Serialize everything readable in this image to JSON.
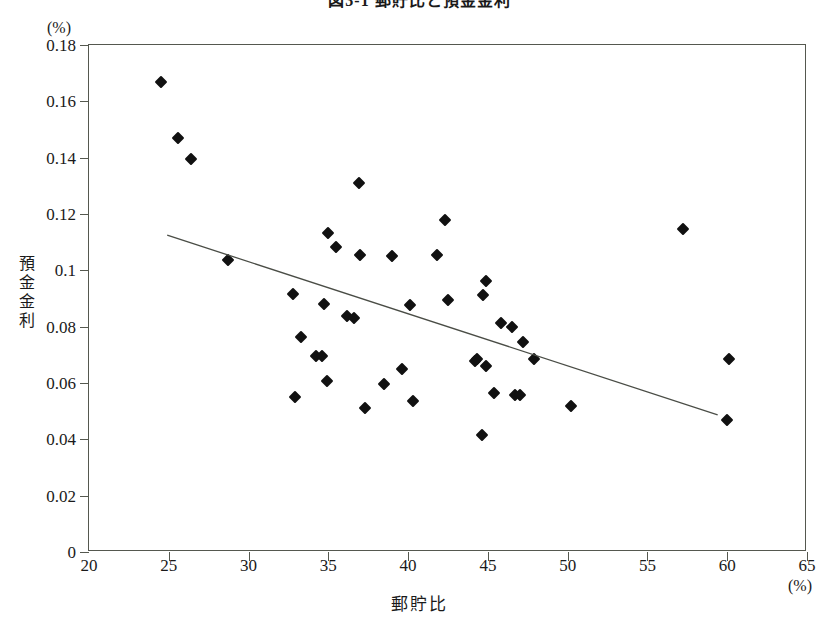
{
  "chart_data": {
    "type": "scatter",
    "title": "図3-1 郵貯比と預金金利",
    "xlabel": "郵貯比",
    "ylabel": "預金金利",
    "x_unit": "(%)",
    "y_unit": "(%)",
    "xlim": [
      20,
      65
    ],
    "ylim": [
      0,
      0.18
    ],
    "grid": false,
    "legend": "none",
    "x_ticks": [
      "20",
      "25",
      "30",
      "35",
      "40",
      "45",
      "50",
      "55",
      "60",
      "65"
    ],
    "x_tick_values": [
      20,
      25,
      30,
      35,
      40,
      45,
      50,
      55,
      60,
      65
    ],
    "y_ticks": [
      "0",
      "0.02",
      "0.04",
      "0.06",
      "0.08",
      "0.1",
      "0.12",
      "0.14",
      "0.16",
      "0.18"
    ],
    "y_tick_values": [
      0,
      0.02,
      0.04,
      0.06,
      0.08,
      0.1,
      0.12,
      0.14,
      0.16,
      0.18
    ],
    "marker": "filled-diamond",
    "marker_color": "#111111",
    "axis_color": "#55584f",
    "trendline": {
      "label": "regression-line",
      "color": "#4a4d46",
      "x_start": 24.9,
      "y_start": 0.1125,
      "x_end": 59.4,
      "y_end": 0.0487
    },
    "points": [
      {
        "x": 24.5,
        "y": 0.167
      },
      {
        "x": 25.6,
        "y": 0.147
      },
      {
        "x": 26.4,
        "y": 0.1395
      },
      {
        "x": 28.7,
        "y": 0.1035
      },
      {
        "x": 32.8,
        "y": 0.0915
      },
      {
        "x": 32.9,
        "y": 0.0551
      },
      {
        "x": 33.3,
        "y": 0.0763
      },
      {
        "x": 34.2,
        "y": 0.0697
      },
      {
        "x": 34.6,
        "y": 0.0695
      },
      {
        "x": 34.7,
        "y": 0.0879
      },
      {
        "x": 34.9,
        "y": 0.0607
      },
      {
        "x": 35.0,
        "y": 0.1133
      },
      {
        "x": 35.5,
        "y": 0.1084
      },
      {
        "x": 36.2,
        "y": 0.0837
      },
      {
        "x": 36.6,
        "y": 0.0832
      },
      {
        "x": 36.9,
        "y": 0.131
      },
      {
        "x": 37.0,
        "y": 0.1055
      },
      {
        "x": 37.3,
        "y": 0.0512
      },
      {
        "x": 38.5,
        "y": 0.0598
      },
      {
        "x": 39.0,
        "y": 0.1051
      },
      {
        "x": 39.6,
        "y": 0.0648
      },
      {
        "x": 40.1,
        "y": 0.0878
      },
      {
        "x": 40.3,
        "y": 0.0537
      },
      {
        "x": 41.8,
        "y": 0.1055
      },
      {
        "x": 42.3,
        "y": 0.1177
      },
      {
        "x": 42.5,
        "y": 0.0893
      },
      {
        "x": 44.2,
        "y": 0.0679
      },
      {
        "x": 44.3,
        "y": 0.0684
      },
      {
        "x": 44.6,
        "y": 0.0417
      },
      {
        "x": 44.7,
        "y": 0.0913
      },
      {
        "x": 44.9,
        "y": 0.0963
      },
      {
        "x": 44.9,
        "y": 0.0661
      },
      {
        "x": 45.4,
        "y": 0.0564
      },
      {
        "x": 45.8,
        "y": 0.0812
      },
      {
        "x": 46.5,
        "y": 0.0799
      },
      {
        "x": 46.7,
        "y": 0.0556
      },
      {
        "x": 47.0,
        "y": 0.0557
      },
      {
        "x": 47.2,
        "y": 0.0746
      },
      {
        "x": 47.9,
        "y": 0.0685
      },
      {
        "x": 50.2,
        "y": 0.0518
      },
      {
        "x": 57.2,
        "y": 0.1145
      },
      {
        "x": 60.1,
        "y": 0.0685
      },
      {
        "x": 60.0,
        "y": 0.047
      }
    ]
  }
}
